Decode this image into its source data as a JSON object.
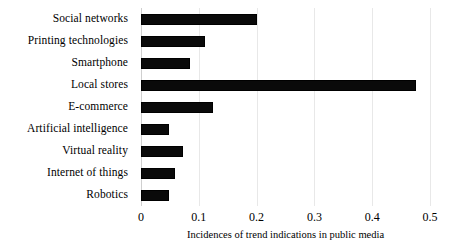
{
  "chart_data": {
    "type": "bar",
    "orientation": "horizontal",
    "title": "",
    "subtitle": "",
    "xlabel": "Incidences of trend indications in public media",
    "ylabel": "",
    "xlim": [
      0,
      0.5
    ],
    "ylim": null,
    "grid": true,
    "legend": null,
    "legend_position": "none",
    "xticks": [
      "0",
      "0.1",
      "0.2",
      "0.3",
      "0.4",
      "0.5"
    ],
    "xtick_values": [
      0,
      0.1,
      0.2,
      0.3,
      0.4,
      0.5
    ],
    "categories": [
      "Social networks",
      "Printing technologies",
      "Smartphone",
      "Local stores",
      "E-commerce",
      "Artificial intelligence",
      "Virtual reality",
      "Internet of things",
      "Robotics"
    ],
    "values": [
      0.2,
      0.11,
      0.085,
      0.475,
      0.125,
      0.048,
      0.072,
      0.059,
      0.048
    ],
    "series": [
      {
        "name": "Incidences of trend indications in public media",
        "values": [
          0.2,
          0.11,
          0.085,
          0.475,
          0.125,
          0.048,
          0.072,
          0.059,
          0.048
        ]
      }
    ],
    "colors": {
      "bar": "#0a0a0a",
      "gridline": "#e8e8e8",
      "axis": "#cfcfcf",
      "text": "#000000",
      "background": "#ffffff"
    }
  }
}
